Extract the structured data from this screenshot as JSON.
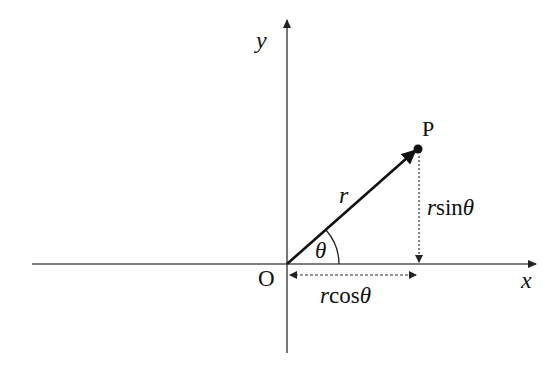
{
  "diagram": {
    "type": "polar-coordinates",
    "axes": {
      "x_label": "x",
      "y_label": "y",
      "origin_label": "O"
    },
    "point": {
      "label": "P"
    },
    "vector": {
      "label": "r"
    },
    "angle": {
      "label": "θ"
    },
    "components": {
      "horizontal": {
        "prefix": "r",
        "func": "cos",
        "angle": "θ"
      },
      "vertical": {
        "prefix": "r",
        "func": "sin",
        "angle": "θ"
      }
    },
    "colors": {
      "line": "#111111",
      "axis": "#555555",
      "background": "#ffffff"
    }
  }
}
